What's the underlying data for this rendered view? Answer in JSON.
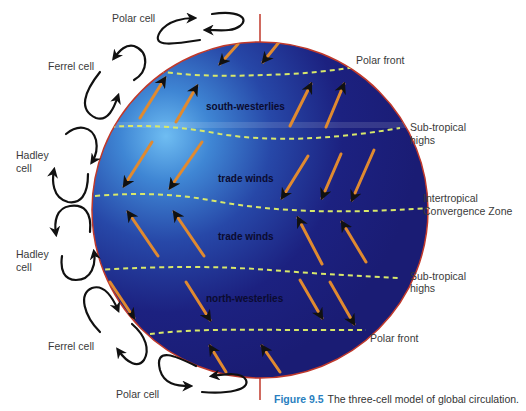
{
  "figure": {
    "number_label": "Figure 9.5",
    "caption_text": "The three-cell model of global circulation."
  },
  "cells": {
    "north_polar": "Polar cell",
    "north_ferrel": "Ferrel cell",
    "north_hadley_line1": "Hadley",
    "north_hadley_line2": "cell",
    "south_hadley_line1": "Hadley",
    "south_hadley_line2": "cell",
    "south_ferrel": "Ferrel cell",
    "south_polar": "Polar cell"
  },
  "boundaries": {
    "north_polar_front": "Polar front",
    "north_subtropical_line1": "Sub-tropical",
    "north_subtropical_line2": "highs",
    "itcz_line1": "Intertropical",
    "itcz_line2": "Convergence Zone",
    "south_subtropical_line1": "Sub-tropical",
    "south_subtropical_line2": "highs",
    "south_polar_front": "Polar front"
  },
  "wind_zones": {
    "south_westerlies": "south-westerlies",
    "trade_winds_north": "trade winds",
    "trade_winds_south": "trade winds",
    "north_westerlies": "north-westerlies"
  },
  "colors": {
    "globe_dark": "#1c1f78",
    "globe_light": "#5aa8e8",
    "globe_rim": "#c0392b",
    "boundary_dash": "#d8e86a",
    "wind_arrow": "#e08a30",
    "caption_accent": "#2a7fc0"
  }
}
